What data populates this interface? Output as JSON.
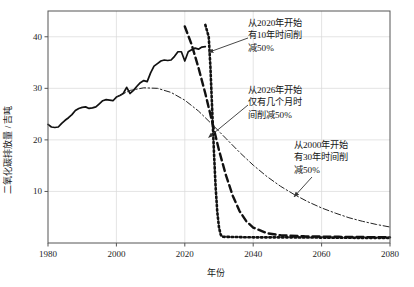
{
  "chart_data": {
    "type": "line",
    "title": "",
    "xlabel": "年份",
    "ylabel": "二氧化碳排放量 / 吉吨",
    "xlim": [
      1980,
      2080
    ],
    "ylim": [
      0,
      45
    ],
    "xticks": [
      "1980",
      "2000",
      "2020",
      "2040",
      "2060",
      "2080"
    ],
    "xtick_values": [
      1980,
      2000,
      2020,
      2040,
      2060,
      2080
    ],
    "yticks": [
      "10",
      "20",
      "30",
      "40"
    ],
    "ytick_values": [
      10,
      20,
      30,
      40
    ],
    "grid": true,
    "legend_position": "none",
    "series": [
      {
        "name": "历史排放",
        "style": "solid",
        "color": "#111111",
        "points": [
          [
            1980,
            23.0
          ],
          [
            1981,
            22.5
          ],
          [
            1982,
            22.4
          ],
          [
            1983,
            22.5
          ],
          [
            1984,
            23.2
          ],
          [
            1985,
            23.8
          ],
          [
            1986,
            24.3
          ],
          [
            1987,
            24.9
          ],
          [
            1988,
            25.7
          ],
          [
            1989,
            26.1
          ],
          [
            1990,
            26.3
          ],
          [
            1991,
            26.4
          ],
          [
            1992,
            26.1
          ],
          [
            1993,
            26.2
          ],
          [
            1994,
            26.4
          ],
          [
            1995,
            27.0
          ],
          [
            1996,
            27.6
          ],
          [
            1997,
            27.8
          ],
          [
            1998,
            27.7
          ],
          [
            1999,
            27.6
          ],
          [
            2000,
            28.3
          ],
          [
            2001,
            28.6
          ],
          [
            2002,
            29.0
          ],
          [
            2003,
            30.2
          ],
          [
            2004,
            29.0
          ],
          [
            2005,
            29.6
          ],
          [
            2006,
            30.4
          ],
          [
            2007,
            31.1
          ],
          [
            2008,
            31.5
          ],
          [
            2009,
            31.3
          ],
          [
            2010,
            33.0
          ],
          [
            2011,
            34.3
          ],
          [
            2012,
            34.8
          ],
          [
            2013,
            35.3
          ],
          [
            2014,
            35.5
          ],
          [
            2015,
            35.4
          ],
          [
            2016,
            35.5
          ],
          [
            2017,
            36.2
          ],
          [
            2018,
            37.1
          ],
          [
            2019,
            37.1
          ],
          [
            2020,
            35.3
          ],
          [
            2021,
            37.1
          ],
          [
            2022,
            37.5
          ],
          [
            2023,
            37.8
          ],
          [
            2024,
            37.6
          ],
          [
            2025,
            38.0
          ],
          [
            2026,
            38.1
          ]
        ]
      },
      {
        "name": "从2000年开始有30年时间削减50%",
        "style": "dashdot",
        "color": "#222222",
        "points": [
          [
            2000,
            28.3
          ],
          [
            2004,
            29.6
          ],
          [
            2008,
            30.1
          ],
          [
            2012,
            30.0
          ],
          [
            2016,
            29.2
          ],
          [
            2020,
            27.7
          ],
          [
            2024,
            25.6
          ],
          [
            2028,
            23.0
          ],
          [
            2032,
            20.3
          ],
          [
            2036,
            17.6
          ],
          [
            2040,
            15.1
          ],
          [
            2044,
            12.9
          ],
          [
            2048,
            11.0
          ],
          [
            2052,
            9.4
          ],
          [
            2056,
            8.0
          ],
          [
            2060,
            6.8
          ],
          [
            2064,
            5.8
          ],
          [
            2068,
            4.9
          ],
          [
            2072,
            4.2
          ],
          [
            2076,
            3.6
          ],
          [
            2080,
            3.1
          ]
        ]
      },
      {
        "name": "从2020年开始有10年时间削减50%",
        "style": "dashed",
        "color": "#111111",
        "points": [
          [
            2020,
            42.0
          ],
          [
            2022,
            38.5
          ],
          [
            2024,
            34.0
          ],
          [
            2026,
            29.0
          ],
          [
            2028,
            23.5
          ],
          [
            2030,
            18.0
          ],
          [
            2032,
            13.2
          ],
          [
            2034,
            9.2
          ],
          [
            2036,
            6.2
          ],
          [
            2038,
            4.2
          ],
          [
            2040,
            3.0
          ],
          [
            2044,
            1.9
          ],
          [
            2048,
            1.5
          ],
          [
            2055,
            1.3
          ],
          [
            2065,
            1.2
          ],
          [
            2080,
            1.1
          ]
        ]
      },
      {
        "name": "从2026年开始仅有几个月时间削减50%",
        "style": "dotted",
        "color": "#111111",
        "points": [
          [
            2026,
            42.3
          ],
          [
            2027,
            40.0
          ],
          [
            2027.5,
            34.0
          ],
          [
            2028,
            26.0
          ],
          [
            2028.5,
            18.0
          ],
          [
            2029,
            11.0
          ],
          [
            2029.5,
            6.0
          ],
          [
            2030,
            3.0
          ],
          [
            2030.5,
            1.6
          ],
          [
            2031,
            1.2
          ],
          [
            2040,
            1.1
          ],
          [
            2050,
            1.1
          ],
          [
            2060,
            1.05
          ],
          [
            2070,
            1.0
          ],
          [
            2080,
            1.0
          ]
        ]
      }
    ],
    "annotations": [
      {
        "id": "anno-0",
        "text": "从2020年开始\n有10年时间削\n减50%",
        "target_x": 2027,
        "target_y": 37.0
      },
      {
        "id": "anno-1",
        "text": "从2026年开始\n仅有几个月时\n间削减50%",
        "target_x": 2027,
        "target_y": 20.5
      },
      {
        "id": "anno-2",
        "text": "从2000年开始\n有30年时间削\n减50%",
        "target_x": 2052,
        "target_y": 9.0
      }
    ]
  }
}
